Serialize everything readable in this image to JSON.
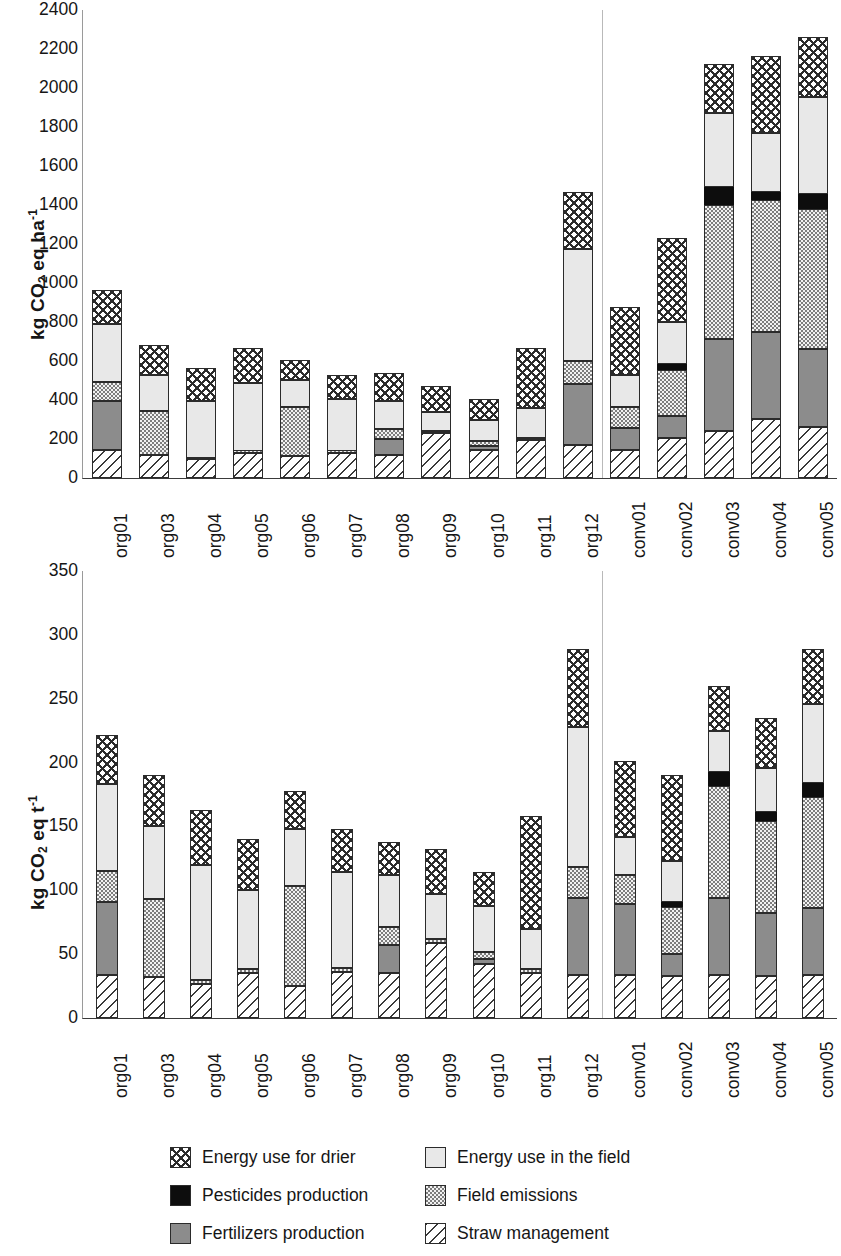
{
  "chart_data": [
    {
      "type": "bar",
      "subtype": "stacked-bar",
      "panel": "a)",
      "title": "",
      "xlabel": "",
      "ylabel": "kg CO2 eq ha-1",
      "ylim": [
        0,
        2400
      ],
      "yticks": [
        0,
        200,
        400,
        600,
        800,
        1000,
        1200,
        1400,
        1600,
        1800,
        2000,
        2200,
        2400
      ],
      "grid": false,
      "legend_position": "bottom",
      "group_divider_after": "org12",
      "categories": [
        "org01",
        "org03",
        "org04",
        "org05",
        "org06",
        "org07",
        "org08",
        "org09",
        "org10",
        "org11",
        "org12",
        "conv01",
        "conv02",
        "conv03",
        "conv04",
        "conv05"
      ],
      "series": [
        {
          "name": "Straw management",
          "values": [
            145,
            120,
            95,
            130,
            115,
            130,
            120,
            230,
            145,
            195,
            170,
            145,
            205,
            240,
            305,
            260
          ]
        },
        {
          "name": "Fertilizers production",
          "values": [
            250,
            0,
            0,
            0,
            0,
            0,
            80,
            0,
            20,
            0,
            310,
            110,
            115,
            475,
            445,
            400
          ]
        },
        {
          "name": "Field emissions",
          "values": [
            95,
            225,
            10,
            10,
            250,
            10,
            50,
            10,
            25,
            10,
            120,
            110,
            235,
            685,
            675,
            720
          ]
        },
        {
          "name": "Pesticides production",
          "values": [
            0,
            0,
            0,
            0,
            0,
            0,
            0,
            0,
            0,
            0,
            0,
            0,
            30,
            90,
            40,
            75
          ]
        },
        {
          "name": "Energy use in the field",
          "values": [
            300,
            185,
            290,
            345,
            140,
            265,
            145,
            100,
            105,
            155,
            575,
            165,
            215,
            380,
            305,
            500
          ]
        },
        {
          "name": "Energy use for drier",
          "values": [
            175,
            150,
            170,
            180,
            100,
            125,
            145,
            130,
            110,
            305,
            290,
            345,
            430,
            255,
            395,
            305
          ]
        }
      ]
    },
    {
      "type": "bar",
      "subtype": "stacked-bar",
      "panel": "b)",
      "title": "",
      "xlabel": "",
      "ylabel": "kg CO2 eq t-1",
      "ylim": [
        0,
        350
      ],
      "yticks": [
        0,
        50,
        100,
        150,
        200,
        250,
        300,
        350
      ],
      "grid": false,
      "legend_position": "bottom",
      "group_divider_after": "org12",
      "categories": [
        "org01",
        "org03",
        "org04",
        "org05",
        "org06",
        "org07",
        "org08",
        "org09",
        "org10",
        "org11",
        "org12",
        "conv01",
        "conv02",
        "conv03",
        "conv04",
        "conv05"
      ],
      "series": [
        {
          "name": "Straw management",
          "values": [
            34,
            32,
            27,
            35,
            25,
            36,
            35,
            59,
            42,
            35,
            34,
            34,
            33,
            34,
            33,
            34
          ]
        },
        {
          "name": "Fertilizers production",
          "values": [
            57,
            0,
            0,
            0,
            0,
            0,
            22,
            0,
            4,
            0,
            60,
            55,
            17,
            60,
            49,
            52
          ]
        },
        {
          "name": "Field emissions",
          "values": [
            24,
            61,
            3,
            3,
            78,
            3,
            14,
            3,
            6,
            3,
            24,
            23,
            37,
            88,
            72,
            87
          ]
        },
        {
          "name": "Pesticides production",
          "values": [
            0,
            0,
            0,
            0,
            0,
            0,
            0,
            0,
            0,
            0,
            0,
            0,
            4,
            11,
            7,
            11
          ]
        },
        {
          "name": "Energy use in the field",
          "values": [
            68,
            57,
            90,
            62,
            45,
            75,
            41,
            35,
            36,
            32,
            110,
            30,
            32,
            32,
            35,
            62
          ]
        },
        {
          "name": "Energy use for drier",
          "values": [
            39,
            40,
            43,
            40,
            30,
            34,
            26,
            35,
            26,
            88,
            61,
            59,
            67,
            35,
            39,
            43
          ]
        }
      ]
    }
  ],
  "panel_a": {
    "letter": "a)",
    "ylabel_prefix": "kg CO",
    "ylabel_sub": "2",
    "ylabel_mid": " eq ha",
    "ylabel_sup": "-1"
  },
  "panel_b": {
    "letter": "b)",
    "ylabel_prefix": "kg CO",
    "ylabel_sub": "2",
    "ylabel_mid": " eq t",
    "ylabel_sup": "-1"
  },
  "legend": {
    "entries": [
      {
        "label": "Energy use for drier",
        "pattern": "drier",
        "color": "#ffffff"
      },
      {
        "label": "Energy use in the field",
        "pattern": "field",
        "color": "#e8e8e8"
      },
      {
        "label": "Pesticides production",
        "pattern": "pest",
        "color": "#0d0d0d"
      },
      {
        "label": "Field emissions",
        "pattern": "emis",
        "color": "#c9c9c9"
      },
      {
        "label": "Fertilizers production",
        "pattern": "fert",
        "color": "#8c8c8c"
      },
      {
        "label": "Straw management",
        "pattern": "straw",
        "color": "#ffffff"
      }
    ]
  }
}
